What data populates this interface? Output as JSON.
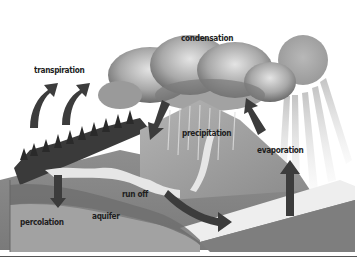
{
  "diagram": {
    "type": "illustrated process diagram",
    "labels": {
      "condensation": "condensation",
      "transpiration": "transpiration",
      "precipitation": "precipitation",
      "evaporation": "evaporation",
      "run_off": "run off",
      "percolation": "percolation",
      "aquifer": "aquifer"
    },
    "elements": [
      "sun",
      "clouds",
      "forest",
      "mountain",
      "river",
      "lake",
      "ground-layers",
      "arrows"
    ],
    "colors": {
      "background": "#ffffff",
      "arrow": "#3c3c3c",
      "sun": "#a8a8a8",
      "cloud_dark": "#6e6e6e",
      "cloud_light": "#d8d8d8",
      "ground_top": "#8c8c8c",
      "ground_mid": "#7a7a7a",
      "ground_low": "#a0a0a0",
      "water": "#e6e6e6",
      "label": "#1e1e1e"
    }
  }
}
